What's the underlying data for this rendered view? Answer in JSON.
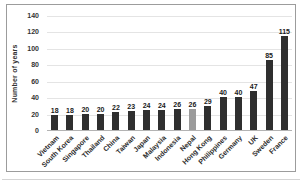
{
  "chart_data": {
    "type": "bar",
    "title": "",
    "xlabel": "",
    "ylabel": "Number of years",
    "ylim": [
      0,
      140
    ],
    "yticks": [
      0,
      20,
      40,
      60,
      80,
      100,
      120,
      140
    ],
    "grid": true,
    "legend": false,
    "value_labels": true,
    "categories": [
      "Vietnam",
      "South Korea",
      "Singapore",
      "Thailand",
      "China",
      "Taiwan",
      "Japan",
      "Malaysia",
      "Indonesia",
      "Nepal",
      "Hong Kong",
      "Philippines",
      "Germany",
      "UK",
      "Sweden",
      "France"
    ],
    "values": [
      18,
      18,
      20,
      20,
      22,
      23,
      24,
      24,
      26,
      26,
      29,
      40,
      40,
      47,
      85,
      115
    ],
    "bar_color": "#2f2f2f",
    "highlight_index": 9,
    "highlight_color": "#9b9b9b",
    "frame_border_color": "#9c9c9c",
    "gridline_color": "#e4e4e4"
  }
}
